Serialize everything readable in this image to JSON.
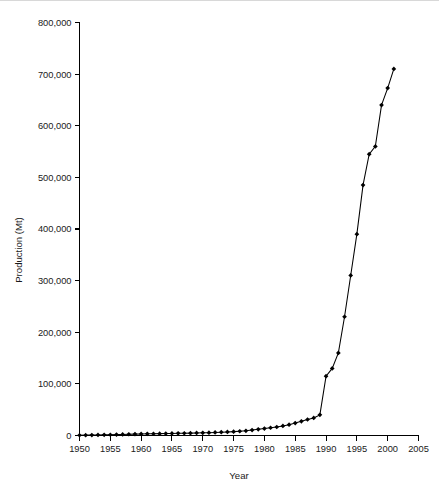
{
  "figure": {
    "background_color": "#ffffff",
    "foreground_color": "#000000"
  },
  "chart_data": {
    "type": "line",
    "title": "",
    "subtitle": "",
    "xlabel": "Year",
    "ylabel": "Production (Mt)",
    "xlim": [
      1950,
      2005
    ],
    "ylim": [
      0,
      800000
    ],
    "xticks": [
      1950,
      1955,
      1960,
      1965,
      1970,
      1975,
      1980,
      1985,
      1990,
      1995,
      2000,
      2005
    ],
    "xtick_labels": [
      "1950",
      "1955",
      "1960",
      "1965",
      "1970",
      "1975",
      "1980",
      "1985",
      "1990",
      "1995",
      "2000",
      "2005"
    ],
    "yticks": [
      0,
      100000,
      200000,
      300000,
      400000,
      500000,
      600000,
      700000,
      800000
    ],
    "ytick_labels": [
      "0",
      "100,000",
      "200,000",
      "300,000",
      "400,000",
      "500,000",
      "600,000",
      "700,000",
      "800,000"
    ],
    "grid": false,
    "legend": null,
    "marker": "filled-diamond",
    "line_color": "#000000",
    "marker_color": "#000000",
    "x": [
      1950,
      1951,
      1952,
      1953,
      1954,
      1955,
      1956,
      1957,
      1958,
      1959,
      1960,
      1961,
      1962,
      1963,
      1964,
      1965,
      1966,
      1967,
      1968,
      1969,
      1970,
      1971,
      1972,
      1973,
      1974,
      1975,
      1976,
      1977,
      1978,
      1979,
      1980,
      1981,
      1982,
      1983,
      1984,
      1985,
      1986,
      1987,
      1988,
      1989,
      1990,
      1991,
      1992,
      1993,
      1994,
      1995,
      1996,
      1997,
      1998,
      1999,
      2000,
      2001
    ],
    "values": [
      500,
      700,
      900,
      1100,
      1300,
      1500,
      1800,
      2100,
      2400,
      2700,
      3000,
      3200,
      3400,
      3600,
      3800,
      4000,
      4200,
      4400,
      4600,
      4900,
      5200,
      5500,
      5900,
      6400,
      6900,
      7500,
      8200,
      9000,
      10500,
      12000,
      13500,
      15000,
      16500,
      18500,
      21000,
      24000,
      27500,
      31000,
      34000,
      40000,
      115000,
      130000,
      160000,
      230000,
      310000,
      390000,
      485000,
      545000,
      560000,
      640000,
      673000,
      710000
    ],
    "series": [
      {
        "name": "Production",
        "values": [
          500,
          700,
          900,
          1100,
          1300,
          1500,
          1800,
          2100,
          2400,
          2700,
          3000,
          3200,
          3400,
          3600,
          3800,
          4000,
          4200,
          4400,
          4600,
          4900,
          5200,
          5500,
          5900,
          6400,
          6900,
          7500,
          8200,
          9000,
          10500,
          12000,
          13500,
          15000,
          16500,
          18500,
          21000,
          24000,
          27500,
          31000,
          34000,
          40000,
          115000,
          130000,
          160000,
          230000,
          310000,
          390000,
          485000,
          545000,
          560000,
          640000,
          673000,
          710000
        ]
      }
    ]
  }
}
